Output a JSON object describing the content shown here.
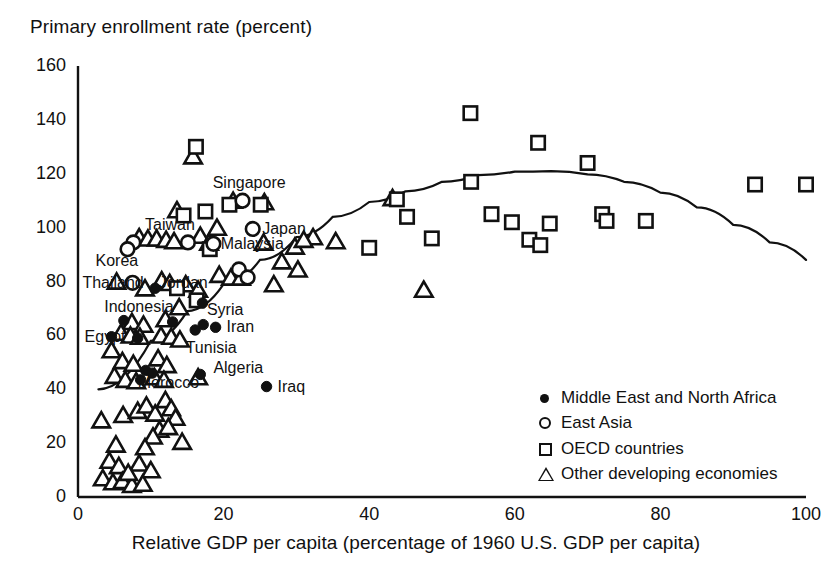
{
  "chart_data": {
    "type": "scatter",
    "title": "Primary enrollment rate (percent)",
    "ylabel": "Primary enrollment rate (percent)",
    "xlabel": "Relative GDP per capita (percentage of 1960 U.S. GDP per capita)",
    "xlim": [
      0,
      100
    ],
    "ylim": [
      0,
      160
    ],
    "xticks": [
      0,
      20,
      40,
      60,
      80,
      100
    ],
    "yticks": [
      0,
      20,
      40,
      60,
      80,
      100,
      120,
      140,
      160
    ],
    "grid": false,
    "legend_position": "lower-right",
    "legend": [
      {
        "marker": "filled-circle",
        "label": "Middle East and North Africa"
      },
      {
        "marker": "open-circle",
        "label": "East Asia"
      },
      {
        "marker": "open-square",
        "label": "OECD countries"
      },
      {
        "marker": "open-triangle",
        "label": "Other developing economies"
      }
    ],
    "series": [
      {
        "name": "Middle East and North Africa",
        "marker": "filled-circle",
        "points": [
          {
            "x": 6.3,
            "y": 65.5,
            "label": null
          },
          {
            "x": 4.6,
            "y": 59.5,
            "label": "Egypt"
          },
          {
            "x": 8.2,
            "y": 59.0,
            "label": null
          },
          {
            "x": 10.6,
            "y": 77.5,
            "label": null
          },
          {
            "x": 13.0,
            "y": 65.0,
            "label": null
          },
          {
            "x": 17.2,
            "y": 64.0,
            "label": null
          },
          {
            "x": 18.9,
            "y": 63.0,
            "label": "Iran"
          },
          {
            "x": 16.1,
            "y": 62.0,
            "label": "Tunisia"
          },
          {
            "x": 17.1,
            "y": 72.0,
            "label": "Syria"
          },
          {
            "x": 9.3,
            "y": 47.0,
            "label": null
          },
          {
            "x": 10.2,
            "y": 46.0,
            "label": null
          },
          {
            "x": 8.6,
            "y": 43.5,
            "label": "Morocco"
          },
          {
            "x": 16.8,
            "y": 45.5,
            "label": "Algeria"
          },
          {
            "x": 25.9,
            "y": 41.0,
            "label": "Iraq"
          }
        ]
      },
      {
        "name": "East Asia",
        "marker": "open-circle",
        "points": [
          {
            "x": 7.6,
            "y": 94.5,
            "label": "Taiwan"
          },
          {
            "x": 6.8,
            "y": 92.0,
            "label": "Korea"
          },
          {
            "x": 15.1,
            "y": 94.5,
            "label": null
          },
          {
            "x": 18.6,
            "y": 94.0,
            "label": "Malaysia"
          },
          {
            "x": 7.5,
            "y": 79.5,
            "label": "Thailand"
          },
          {
            "x": 22.6,
            "y": 110.0,
            "label": "Singapore"
          },
          {
            "x": 24.0,
            "y": 99.5,
            "label": "Japan"
          },
          {
            "x": 22.1,
            "y": 84.5,
            "label": null
          },
          {
            "x": 23.3,
            "y": 81.5,
            "label": null
          }
        ]
      },
      {
        "name": "OECD countries",
        "marker": "open-square",
        "points": [
          {
            "x": 16.2,
            "y": 130.0
          },
          {
            "x": 53.9,
            "y": 142.5
          },
          {
            "x": 63.2,
            "y": 131.5
          },
          {
            "x": 70.0,
            "y": 124.0
          },
          {
            "x": 54.0,
            "y": 117.0
          },
          {
            "x": 93.0,
            "y": 116.0
          },
          {
            "x": 100.0,
            "y": 116.0
          },
          {
            "x": 43.8,
            "y": 110.5
          },
          {
            "x": 17.5,
            "y": 106.0
          },
          {
            "x": 14.5,
            "y": 104.5
          },
          {
            "x": 20.8,
            "y": 108.5
          },
          {
            "x": 25.1,
            "y": 108.5
          },
          {
            "x": 45.2,
            "y": 104.0
          },
          {
            "x": 56.8,
            "y": 105.0
          },
          {
            "x": 59.6,
            "y": 102.0
          },
          {
            "x": 64.8,
            "y": 101.5
          },
          {
            "x": 72.0,
            "y": 105.0
          },
          {
            "x": 72.6,
            "y": 102.5
          },
          {
            "x": 78.0,
            "y": 102.5
          },
          {
            "x": 48.6,
            "y": 96.0
          },
          {
            "x": 40.0,
            "y": 92.5
          },
          {
            "x": 62.0,
            "y": 95.5
          },
          {
            "x": 63.5,
            "y": 93.5
          },
          {
            "x": 18.1,
            "y": 92.0
          },
          {
            "x": 16.3,
            "y": 73.0
          },
          {
            "x": 13.6,
            "y": 77.5
          }
        ]
      },
      {
        "name": "Other developing economies",
        "marker": "open-triangle",
        "points": [
          {
            "x": 15.8,
            "y": 126.0
          },
          {
            "x": 21.3,
            "y": 109.5
          },
          {
            "x": 25.6,
            "y": 109.0
          },
          {
            "x": 13.6,
            "y": 106.0
          },
          {
            "x": 43.2,
            "y": 110.5
          },
          {
            "x": 19.1,
            "y": 99.5
          },
          {
            "x": 8.4,
            "y": 96.0
          },
          {
            "x": 9.6,
            "y": 95.5
          },
          {
            "x": 10.8,
            "y": 95.5
          },
          {
            "x": 12.1,
            "y": 95.0
          },
          {
            "x": 13.2,
            "y": 94.5
          },
          {
            "x": 16.8,
            "y": 96.5
          },
          {
            "x": 18.0,
            "y": 94.0
          },
          {
            "x": 32.3,
            "y": 96.0
          },
          {
            "x": 35.4,
            "y": 94.5
          },
          {
            "x": 29.8,
            "y": 92.5
          },
          {
            "x": 31.0,
            "y": 95.0
          },
          {
            "x": 25.5,
            "y": 94.0
          },
          {
            "x": 5.3,
            "y": 79.5
          },
          {
            "x": 9.2,
            "y": 77.0
          },
          {
            "x": 11.5,
            "y": 80.0
          },
          {
            "x": 12.6,
            "y": 79.0
          },
          {
            "x": 14.8,
            "y": 78.5
          },
          {
            "x": 16.5,
            "y": 76.5
          },
          {
            "x": 19.4,
            "y": 82.0
          },
          {
            "x": 21.0,
            "y": 81.0
          },
          {
            "x": 22.4,
            "y": 81.0
          },
          {
            "x": 28.0,
            "y": 87.0
          },
          {
            "x": 30.2,
            "y": 84.0
          },
          {
            "x": 26.9,
            "y": 78.5
          },
          {
            "x": 47.5,
            "y": 76.5
          },
          {
            "x": 13.9,
            "y": 70.0
          },
          {
            "x": 12.0,
            "y": 65.5
          },
          {
            "x": 7.4,
            "y": 64.5
          },
          {
            "x": 9.0,
            "y": 63.5
          },
          {
            "x": 5.9,
            "y": 60.5
          },
          {
            "x": 7.2,
            "y": 59.5
          },
          {
            "x": 8.5,
            "y": 59.0
          },
          {
            "x": 11.4,
            "y": 59.5
          },
          {
            "x": 12.8,
            "y": 59.0
          },
          {
            "x": 14.0,
            "y": 58.0
          },
          {
            "x": 4.6,
            "y": 54.0
          },
          {
            "x": 6.1,
            "y": 50.0
          },
          {
            "x": 7.6,
            "y": 49.0
          },
          {
            "x": 11.0,
            "y": 51.0
          },
          {
            "x": 12.2,
            "y": 48.5
          },
          {
            "x": 5.0,
            "y": 44.5
          },
          {
            "x": 6.5,
            "y": 43.0
          },
          {
            "x": 8.0,
            "y": 42.5
          },
          {
            "x": 10.5,
            "y": 44.0
          },
          {
            "x": 11.8,
            "y": 43.0
          },
          {
            "x": 16.5,
            "y": 44.0
          },
          {
            "x": 3.2,
            "y": 28.0
          },
          {
            "x": 6.2,
            "y": 30.0
          },
          {
            "x": 8.2,
            "y": 31.5
          },
          {
            "x": 9.4,
            "y": 33.5
          },
          {
            "x": 10.6,
            "y": 30.5
          },
          {
            "x": 12.0,
            "y": 35.5
          },
          {
            "x": 12.8,
            "y": 32.5
          },
          {
            "x": 13.4,
            "y": 29.0
          },
          {
            "x": 11.2,
            "y": 24.5
          },
          {
            "x": 12.4,
            "y": 25.5
          },
          {
            "x": 10.3,
            "y": 22.0
          },
          {
            "x": 14.3,
            "y": 20.0
          },
          {
            "x": 5.2,
            "y": 19.0
          },
          {
            "x": 9.2,
            "y": 18.0
          },
          {
            "x": 4.3,
            "y": 13.0
          },
          {
            "x": 5.6,
            "y": 11.0
          },
          {
            "x": 8.4,
            "y": 12.0
          },
          {
            "x": 10.0,
            "y": 9.5
          },
          {
            "x": 3.4,
            "y": 6.5
          },
          {
            "x": 4.8,
            "y": 5.0
          },
          {
            "x": 6.1,
            "y": 5.5
          },
          {
            "x": 7.4,
            "y": 4.0
          },
          {
            "x": 8.9,
            "y": 4.5
          },
          {
            "x": 6.9,
            "y": 8.5
          }
        ]
      }
    ],
    "fit_curve": {
      "type": "quadratic-fit",
      "description": "concave fitted curve rising from lower-left, peaking near x=62, y=121, then declining to y~88 at x=100",
      "points": [
        {
          "x": 2.8,
          "y": 40.0
        },
        {
          "x": 10,
          "y": 58.0
        },
        {
          "x": 15,
          "y": 69.0
        },
        {
          "x": 20,
          "y": 79.0
        },
        {
          "x": 25,
          "y": 88.0
        },
        {
          "x": 30,
          "y": 96.5
        },
        {
          "x": 35,
          "y": 104.0
        },
        {
          "x": 40,
          "y": 109.5
        },
        {
          "x": 45,
          "y": 113.5
        },
        {
          "x": 50,
          "y": 117.0
        },
        {
          "x": 55,
          "y": 119.5
        },
        {
          "x": 60,
          "y": 120.8
        },
        {
          "x": 65,
          "y": 121.0
        },
        {
          "x": 70,
          "y": 119.8
        },
        {
          "x": 75,
          "y": 117.0
        },
        {
          "x": 80,
          "y": 113.0
        },
        {
          "x": 85,
          "y": 107.5
        },
        {
          "x": 90,
          "y": 101.0
        },
        {
          "x": 95,
          "y": 94.5
        },
        {
          "x": 100,
          "y": 88.0
        }
      ]
    },
    "annotations": [
      {
        "text": "Singapore",
        "x": 18.5,
        "y": 116.5,
        "anchor": "start"
      },
      {
        "text": "Taiwan",
        "x": 9.2,
        "y": 101.0,
        "anchor": "start"
      },
      {
        "text": "Japan",
        "x": 25.3,
        "y": 99.5,
        "anchor": "start"
      },
      {
        "text": "Malaysia",
        "x": 19.6,
        "y": 94.0,
        "anchor": "start"
      },
      {
        "text": "Korea",
        "x": 2.4,
        "y": 87.5,
        "anchor": "start"
      },
      {
        "text": "Thailand",
        "x": 0.6,
        "y": 79.5,
        "anchor": "start"
      },
      {
        "text": "Jordan",
        "x": 11.1,
        "y": 79.5,
        "anchor": "start"
      },
      {
        "text": "Indonesia",
        "x": 3.6,
        "y": 70.5,
        "anchor": "start"
      },
      {
        "text": "Syria",
        "x": 17.7,
        "y": 69.5,
        "anchor": "start"
      },
      {
        "text": "Iran",
        "x": 20.4,
        "y": 63.0,
        "anchor": "start"
      },
      {
        "text": "Egypt",
        "x": 0.9,
        "y": 59.5,
        "anchor": "start"
      },
      {
        "text": "Tunisia",
        "x": 14.8,
        "y": 55.5,
        "anchor": "start"
      },
      {
        "text": "Algeria",
        "x": 18.6,
        "y": 48.0,
        "anchor": "start"
      },
      {
        "text": "Morocco",
        "x": 8.2,
        "y": 42.5,
        "anchor": "start"
      },
      {
        "text": "Iraq",
        "x": 27.4,
        "y": 41.0,
        "anchor": "start"
      }
    ],
    "colors": {
      "ink": "#111111",
      "background": "#ffffff"
    }
  }
}
